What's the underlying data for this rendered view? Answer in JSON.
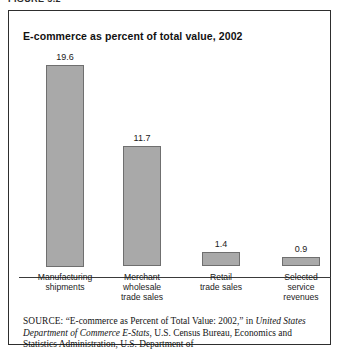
{
  "top_caption": "FIGURE 5.2",
  "figure": {
    "title": "E-commerce as percent of total value, 2002"
  },
  "chart_data": {
    "type": "bar",
    "title": "E-commerce as percent of total value, 2002",
    "xlabel": "",
    "ylabel": "",
    "ylim": [
      0,
      21
    ],
    "grid": false,
    "legend": null,
    "categories": [
      "Manufacturing shipments",
      "Merchant wholesale trade sales",
      "Retail trade sales",
      "Selected service revenues"
    ],
    "category_lines": [
      [
        "Manufacturing",
        "shipments"
      ],
      [
        "Merchant",
        "wholesale",
        "trade sales"
      ],
      [
        "Retail",
        "trade sales"
      ],
      [
        "Selected",
        "service",
        "revenues"
      ]
    ],
    "values": [
      19.6,
      11.7,
      1.4,
      0.9
    ],
    "value_labels": [
      "19.6",
      "11.7",
      "1.4",
      "0.9"
    ],
    "units": "percent",
    "colors": {
      "bar_fill": "#a9a9a9",
      "bar_stroke": "#6f6f6f",
      "axis": "#3a3a3a",
      "frame": "#2e2e2e",
      "text": "#141414"
    }
  },
  "source_note": {
    "label": "SOURCE:",
    "part1": " “E-commerce as Percent of Total Value: 2002,” in ",
    "italic1": "United States Department of Commerce E-Stats",
    "part2": ", U.S. Census Bureau, Economics and Statistics Administration, U.S. Department of"
  }
}
